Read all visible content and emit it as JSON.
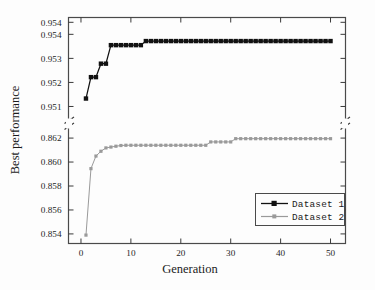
{
  "figure": {
    "background_color": "#fdfdfd",
    "frame_color": "#4a4a4a"
  },
  "chart_data": {
    "type": "line",
    "title": "",
    "subtitle": "",
    "xlabel": "Generation",
    "ylabel": "Best performance",
    "grid": false,
    "broken_y_axis": true,
    "legend_position": "bottom-right",
    "xlim": [
      -2.5,
      53
    ],
    "xticks": [
      0,
      10,
      20,
      30,
      40,
      50
    ],
    "xtick_labels": [
      "0",
      "10",
      "20",
      "30",
      "40",
      "50"
    ],
    "y_upper_panel": {
      "ylim": [
        0.9505,
        0.9547
      ],
      "yticks": [
        0.951,
        0.952,
        0.953,
        0.954,
        0.9545
      ],
      "ytick_labels": [
        "0.951",
        "0.952",
        "0.953",
        "0.954",
        "0.954"
      ]
    },
    "y_lower_panel": {
      "ylim": [
        0.8532,
        0.8628
      ],
      "yticks": [
        0.854,
        0.856,
        0.858,
        0.86,
        0.862
      ],
      "ytick_labels": [
        "0.854",
        "0.856",
        "0.858",
        "0.860",
        "0.862"
      ]
    },
    "series": [
      {
        "name": "Dataset 1",
        "panel": "upper",
        "color": "#111111",
        "marker": "filled-square",
        "x": [
          1,
          2,
          3,
          4,
          5,
          6,
          7,
          8,
          9,
          10,
          11,
          12,
          13,
          14,
          15,
          16,
          17,
          18,
          19,
          20,
          21,
          22,
          23,
          24,
          25,
          26,
          27,
          28,
          29,
          30,
          31,
          32,
          33,
          34,
          35,
          36,
          37,
          38,
          39,
          40,
          41,
          42,
          43,
          44,
          45,
          46,
          47,
          48,
          49,
          50
        ],
        "values": [
          0.95133,
          0.95222,
          0.95222,
          0.95278,
          0.95278,
          0.95355,
          0.95355,
          0.95355,
          0.95355,
          0.95355,
          0.95355,
          0.95355,
          0.95372,
          0.95372,
          0.95372,
          0.95372,
          0.95372,
          0.95372,
          0.95372,
          0.95372,
          0.95372,
          0.95372,
          0.95372,
          0.95372,
          0.95372,
          0.95372,
          0.95372,
          0.95372,
          0.95372,
          0.95372,
          0.95372,
          0.95372,
          0.95372,
          0.95372,
          0.95372,
          0.95372,
          0.95372,
          0.95372,
          0.95372,
          0.95372,
          0.95372,
          0.95372,
          0.95372,
          0.95372,
          0.95372,
          0.95372,
          0.95372,
          0.95372,
          0.95372,
          0.95372
        ]
      },
      {
        "name": "Dataset 2",
        "panel": "lower",
        "color": "#9a9a9a",
        "marker": "small-filled-square",
        "x": [
          1,
          2,
          3,
          4,
          5,
          6,
          7,
          8,
          9,
          10,
          11,
          12,
          13,
          14,
          15,
          16,
          17,
          18,
          19,
          20,
          21,
          22,
          23,
          24,
          25,
          26,
          27,
          28,
          29,
          30,
          31,
          32,
          33,
          34,
          35,
          36,
          37,
          38,
          39,
          40,
          41,
          42,
          43,
          44,
          45,
          46,
          47,
          48,
          49,
          50
        ],
        "values": [
          0.8539,
          0.85945,
          0.8605,
          0.8609,
          0.86118,
          0.86125,
          0.86132,
          0.86138,
          0.8614,
          0.8614,
          0.8614,
          0.8614,
          0.8614,
          0.8614,
          0.8614,
          0.8614,
          0.8614,
          0.8614,
          0.8614,
          0.8614,
          0.8614,
          0.8614,
          0.8614,
          0.8614,
          0.8614,
          0.86168,
          0.86168,
          0.86168,
          0.86168,
          0.86168,
          0.86195,
          0.86195,
          0.86195,
          0.86195,
          0.86195,
          0.86195,
          0.86195,
          0.86195,
          0.86195,
          0.86195,
          0.86195,
          0.86195,
          0.86195,
          0.86195,
          0.86195,
          0.86195,
          0.86195,
          0.86195,
          0.86195,
          0.86195
        ]
      }
    ],
    "legend": [
      {
        "label": "Dataset 1",
        "color": "#111111",
        "marker": "filled-square"
      },
      {
        "label": "Dataset 2",
        "color": "#9a9a9a",
        "marker": "small-filled-square"
      }
    ]
  }
}
